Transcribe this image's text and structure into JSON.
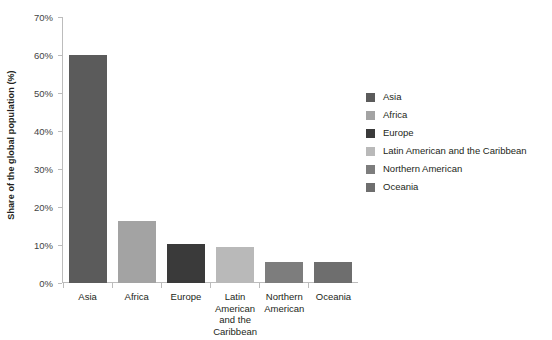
{
  "chart_data": {
    "type": "bar",
    "title": "",
    "xlabel": "",
    "ylabel": "Share of the global population (%)",
    "categories": [
      "Asia",
      "Africa",
      "Europe",
      "Latin American and the Caribbean",
      "Northern American",
      "Oceania"
    ],
    "values": [
      59.9,
      16.4,
      10.3,
      9.5,
      5.6,
      5.6
    ],
    "ylim": [
      0,
      70
    ],
    "yticks": [
      70,
      60,
      50,
      40,
      30,
      20,
      10,
      0
    ],
    "ytick_labels": [
      "70%",
      "60%",
      "50%",
      "40%",
      "30%",
      "20%",
      "10%",
      "0%"
    ],
    "grid": false,
    "legend_position": "right",
    "bar_colors": [
      "#5b5b5b",
      "#a3a3a3",
      "#3a3a3a",
      "#b9b9b9",
      "#7d7d7d",
      "#6e6e6e"
    ]
  },
  "axes": {
    "y_title": "Share of the global population (%)",
    "y_ticks": [
      {
        "label": "70%",
        "value": 70
      },
      {
        "label": "60%",
        "value": 60
      },
      {
        "label": "50%",
        "value": 50
      },
      {
        "label": "40%",
        "value": 40
      },
      {
        "label": "30%",
        "value": 30
      },
      {
        "label": "20%",
        "value": 20
      },
      {
        "label": "10%",
        "value": 10
      },
      {
        "label": "0%",
        "value": 0
      }
    ],
    "x_labels": [
      "Asia",
      "Africa",
      "Europe",
      "Latin American and the Caribbean",
      "Northern American",
      "Oceania"
    ]
  },
  "legend": {
    "items": [
      {
        "label": "Asia",
        "color": "#5b5b5b"
      },
      {
        "label": "Africa",
        "color": "#a3a3a3"
      },
      {
        "label": "Europe",
        "color": "#3a3a3a"
      },
      {
        "label": "Latin American and the Caribbean",
        "color": "#b9b9b9"
      },
      {
        "label": "Northern American",
        "color": "#7d7d7d"
      },
      {
        "label": "Oceania",
        "color": "#6e6e6e"
      }
    ]
  }
}
